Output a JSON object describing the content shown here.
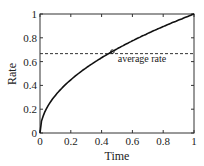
{
  "chart_data": {
    "type": "line",
    "title": "",
    "xlabel": "Time",
    "ylabel": "Rate",
    "xlim": [
      0,
      1
    ],
    "ylim": [
      0,
      1
    ],
    "xticks": [
      "0",
      "0.2",
      "0.4",
      "0.6",
      "0.8",
      "1"
    ],
    "yticks": [
      "0",
      "0.2",
      "0.4",
      "0.6",
      "0.8",
      "1"
    ],
    "grid": false,
    "series": [
      {
        "name": "rate",
        "style": "solid",
        "x": [
          0,
          0.01,
          0.05,
          0.1,
          0.2,
          0.3,
          0.4,
          0.5,
          0.6,
          0.7,
          0.8,
          0.9,
          1.0
        ],
        "y": [
          0,
          0.1,
          0.224,
          0.316,
          0.447,
          0.548,
          0.632,
          0.707,
          0.775,
          0.837,
          0.894,
          0.949,
          1.0
        ]
      },
      {
        "name": "average rate",
        "style": "dashed",
        "x": [
          0,
          1
        ],
        "y": [
          0.667,
          0.667
        ]
      }
    ],
    "annotations": [
      {
        "text": "average rate",
        "x": 0.55,
        "y": 0.6
      },
      {
        "marker": "circle",
        "x": 0.444,
        "y": 0.667
      }
    ]
  }
}
